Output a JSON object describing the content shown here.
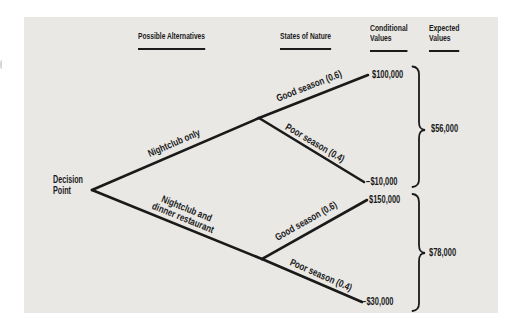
{
  "colors": {
    "page_bg": "#ffffff",
    "panel_bg": "#e9e8e5",
    "ink": "#1b1b1b"
  },
  "headers": {
    "alternatives": "Possible Alternatives",
    "states": "States of Nature",
    "conditional": [
      "Conditional",
      "Values"
    ],
    "expected": [
      "Expected",
      "Values"
    ]
  },
  "decision_point": [
    "Decision",
    "Point"
  ],
  "tree": {
    "branches": [
      {
        "alternative_lines": [
          "Nightclub only"
        ],
        "expected_value": "$56,000",
        "outcomes": [
          {
            "state": "Good season (0.6)",
            "value": "$100,000"
          },
          {
            "state": "Poor season (0.4)",
            "value": "−$10,000"
          }
        ]
      },
      {
        "alternative_lines": [
          "Nightclub and",
          "dinner restaurant"
        ],
        "expected_value": "$78,000",
        "outcomes": [
          {
            "state": "Good season (0.6)",
            "value": "$150,000"
          },
          {
            "state": "Poor season (0.4)",
            "value": "−$30,000"
          }
        ]
      }
    ]
  }
}
